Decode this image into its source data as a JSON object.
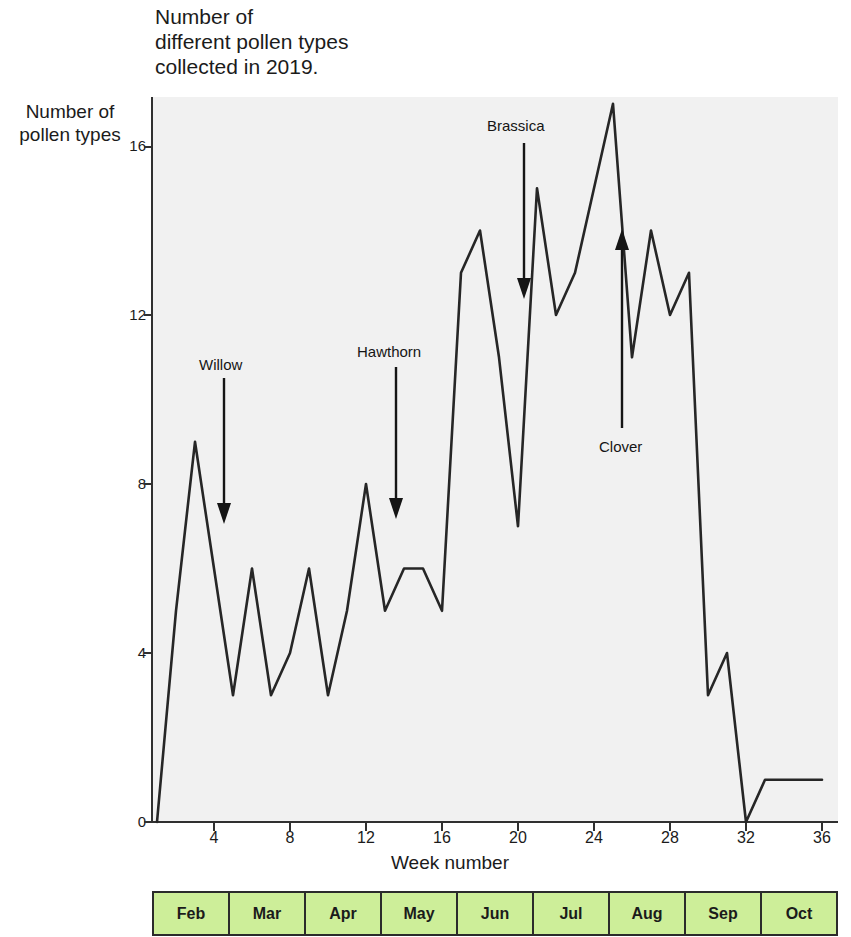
{
  "chart": {
    "title": "Number of\ndifferent pollen types\ncollected in 2019.",
    "y_caption": "Number of\npollen types",
    "x_axis_title": "Week number"
  },
  "axes": {
    "y_ticks": [
      "0",
      "4",
      "8",
      "12",
      "16"
    ],
    "x_ticks": [
      "4",
      "8",
      "12",
      "16",
      "20",
      "24",
      "28",
      "32",
      "36"
    ]
  },
  "annotations": [
    {
      "label": "Willow",
      "direction": "down"
    },
    {
      "label": "Hawthorn",
      "direction": "down"
    },
    {
      "label": "Brassica",
      "direction": "down"
    },
    {
      "label": "Clover",
      "direction": "up"
    }
  ],
  "months": [
    "Feb",
    "Mar",
    "Apr",
    "May",
    "Jun",
    "Jul",
    "Aug",
    "Sep",
    "Oct"
  ],
  "colors": {
    "plot_background": "#f1f1f1",
    "line": "#262626",
    "month_band_fill": "#cdee99",
    "month_band_border": "#2b2b2b",
    "text": "#1b1b1b"
  },
  "chart_data": {
    "type": "line",
    "title": "Number of different pollen types collected in 2019.",
    "xlabel": "Week number",
    "ylabel": "Number of pollen types",
    "xlim": [
      1,
      36
    ],
    "ylim": [
      0,
      18
    ],
    "ytick_values": [
      0,
      4,
      8,
      12,
      16
    ],
    "xtick_values": [
      4,
      8,
      12,
      16,
      20,
      24,
      28,
      32,
      36
    ],
    "grid": false,
    "legend": "none",
    "x": [
      1,
      2,
      3,
      4,
      5,
      6,
      7,
      8,
      9,
      10,
      11,
      12,
      13,
      14,
      15,
      16,
      17,
      18,
      19,
      20,
      21,
      22,
      23,
      24,
      25,
      26,
      27,
      28,
      29,
      30,
      31,
      32,
      33,
      34,
      35,
      36
    ],
    "values": [
      0,
      5,
      9,
      6,
      3,
      6,
      3,
      4,
      6,
      3,
      5,
      8,
      5,
      6,
      6,
      5,
      13,
      14,
      11,
      7,
      15,
      12,
      13,
      15,
      17,
      11,
      14,
      12,
      13,
      3,
      4,
      0,
      1,
      1,
      1,
      1
    ],
    "annotations": [
      {
        "label": "Willow",
        "week": 5,
        "value": 7,
        "arrow": "down"
      },
      {
        "label": "Hawthorn",
        "week": 13,
        "value": 7,
        "arrow": "down"
      },
      {
        "label": "Brassica",
        "week": 20,
        "value": 12,
        "arrow": "down"
      },
      {
        "label": "Clover",
        "week": 25,
        "value": 14,
        "arrow": "up"
      }
    ],
    "month_band": [
      "Feb",
      "Mar",
      "Apr",
      "May",
      "Jun",
      "Jul",
      "Aug",
      "Sep",
      "Oct"
    ]
  }
}
